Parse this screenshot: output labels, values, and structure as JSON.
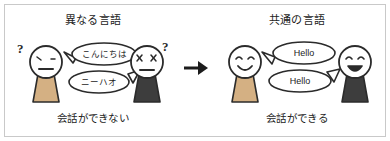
{
  "figure": {
    "background_color": "#ffffff",
    "border_color": "#c9c9c9",
    "outline_color": "#2b2b2b",
    "skin_color": "#ffffff",
    "body_light_color": "#d4b083",
    "body_dark_color": "#3d3d3d",
    "arrow_icon": "right-arrow-icon"
  },
  "panels": {
    "left": {
      "title": "異なる言語",
      "caption": "会話ができない",
      "figure_a": {
        "expression": "neutral-worried",
        "body_color": "#d4b083",
        "thought_marker": "?"
      },
      "figure_b": {
        "expression": "x-eyes",
        "body_color": "#3d3d3d",
        "thought_marker": "?"
      },
      "bubbles": [
        {
          "text": "こんにちは",
          "tail": "left"
        },
        {
          "text": "ニーハオ",
          "tail": "right"
        }
      ]
    },
    "right": {
      "title": "共通の言語",
      "caption": "会話ができる",
      "figure_a": {
        "expression": "smile",
        "body_color": "#d4b083",
        "thought_marker": ""
      },
      "figure_b": {
        "expression": "open-smile",
        "body_color": "#3d3d3d",
        "thought_marker": ""
      },
      "bubbles": [
        {
          "text": "Hello",
          "tail": "left"
        },
        {
          "text": "Hello",
          "tail": "right"
        }
      ]
    }
  }
}
